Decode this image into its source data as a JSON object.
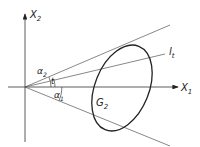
{
  "diagram": {
    "axes": {
      "x_label": "X",
      "x_sub": "1",
      "y_label": "X",
      "y_sub": "2"
    },
    "line_label": {
      "main": "l",
      "sub": "t"
    },
    "region_label": {
      "main": "G",
      "sub": "2"
    },
    "angles": [
      {
        "main": "α",
        "sub": "2"
      },
      {
        "main": "α",
        "sub": "1"
      },
      {
        "main": "t"
      }
    ],
    "colors": {
      "stroke": "#222222",
      "thin": "#555555",
      "background": "#ffffff"
    }
  }
}
